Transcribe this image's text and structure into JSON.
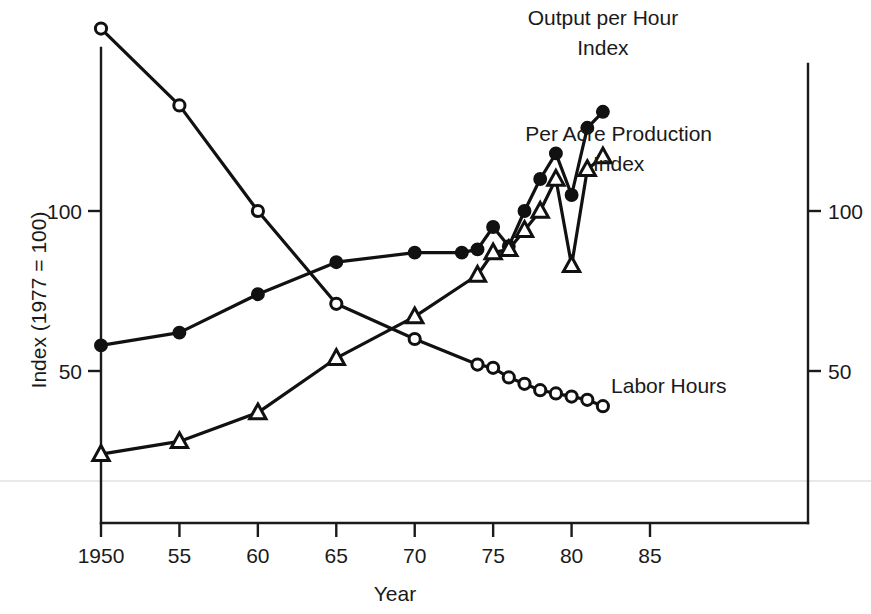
{
  "chart_data": {
    "type": "line",
    "title": "",
    "xlabel": "Year",
    "ylabel": "Index (1977 = 100)",
    "xlim": [
      1949,
      1987
    ],
    "ylim": [
      0,
      165
    ],
    "xticks": [
      1950,
      1955,
      1960,
      1965,
      1970,
      1975,
      1980,
      1985
    ],
    "xtick_labels": [
      "1950",
      "55",
      "60",
      "65",
      "70",
      "75",
      "80",
      "85"
    ],
    "yticks": [
      50,
      100
    ],
    "ytick_labels": [
      "50",
      "100"
    ],
    "right_ytick_labels": [
      "50",
      "100"
    ],
    "grid": false,
    "legend_position": "inline-annotations",
    "series": [
      {
        "name": "Labor Hours",
        "marker": "open-circle",
        "label": "Labor Hours",
        "label_x": 1986.2,
        "label_y": 43,
        "x": [
          1950,
          1955,
          1960,
          1965,
          1970,
          1974,
          1975,
          1976,
          1977,
          1978,
          1979,
          1980,
          1981,
          1982
        ],
        "y": [
          157,
          133,
          100,
          71,
          60,
          52,
          51,
          48,
          46,
          44,
          43,
          42,
          41,
          39
        ]
      },
      {
        "name": "Output per Hour Index",
        "marker": "filled-circle",
        "label": "Output per Hour\nIndex",
        "label_x": 1982.0,
        "label_y": 158,
        "x": [
          1950,
          1955,
          1960,
          1965,
          1970,
          1973,
          1974,
          1975,
          1976,
          1977,
          1978,
          1979,
          1980,
          1981,
          1982
        ],
        "y": [
          58,
          62,
          74,
          84,
          87,
          87,
          88,
          95,
          89,
          100,
          110,
          118,
          105,
          126,
          131
        ]
      },
      {
        "name": "Per Acre Production Index",
        "marker": "open-triangle",
        "label": "Per Acre Production\nIndex",
        "label_x": 1983.0,
        "label_y": 122,
        "x": [
          1950,
          1955,
          1960,
          1965,
          1970,
          1974,
          1975,
          1976,
          1977,
          1978,
          1979,
          1980,
          1981,
          1982
        ],
        "y": [
          24,
          28,
          37,
          54,
          67,
          80,
          87,
          88,
          94,
          100,
          110,
          83,
          113,
          117
        ]
      }
    ],
    "annotations": [
      {
        "id": "output-per-hour-label",
        "lines": [
          "Output per Hour",
          "Index"
        ]
      },
      {
        "id": "per-acre-production-label",
        "lines": [
          "Per Acre Production",
          "Index"
        ]
      },
      {
        "id": "labor-hours-label",
        "lines": [
          "Labor Hours"
        ]
      }
    ]
  },
  "axes": {
    "left_axis_name": "left-y-axis",
    "right_axis_name": "right-y-axis",
    "x_axis_name": "x-axis"
  }
}
